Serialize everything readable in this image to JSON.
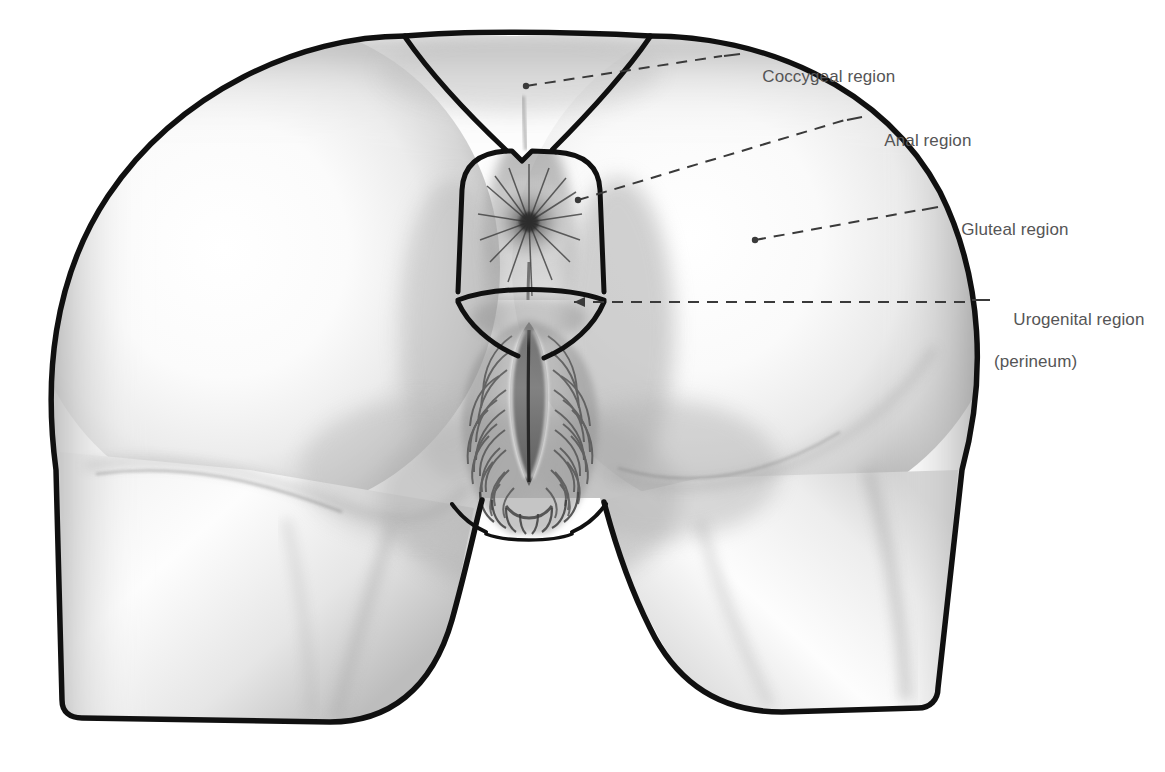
{
  "figure": {
    "kind": "anatomical-illustration",
    "medium": "graphite pencil drawing",
    "background_color": "#ffffff",
    "outline_color": "#101010",
    "label_color": "#555556",
    "leader_color": "#3a3a3a",
    "shading": {
      "skin_light": "#fdfdfd",
      "skin_mid": "#d9d9d9",
      "skin_dark": "#9a9a9a",
      "skin_deep": "#6e6e6e",
      "hair_dark": "#4a4a4a"
    }
  },
  "labels": [
    {
      "id": "coccygeal",
      "name": "coccygeal-region",
      "line1": "Coccygeal region",
      "line2": "",
      "text_x": 743,
      "text_y": 45,
      "dash_x1": 526,
      "dash_y1": 86,
      "dash_x2": 722,
      "dash_y2": 56,
      "tick_x1": 724,
      "tick_y1": 56,
      "tick_x2": 740,
      "tick_y2": 54,
      "dot_x": 526,
      "dot_y": 86
    },
    {
      "id": "anal",
      "name": "anal-region",
      "line1": "Anal region",
      "line2": "",
      "text_x": 866,
      "text_y": 109,
      "dash_x1": 578,
      "dash_y1": 200,
      "dash_x2": 845,
      "dash_y2": 120,
      "tick_x1": 847,
      "tick_y1": 120,
      "tick_x2": 862,
      "tick_y2": 117,
      "dot_x": 578,
      "dot_y": 200
    },
    {
      "id": "gluteal",
      "name": "gluteal-region",
      "line1": "Gluteal region",
      "line2": "",
      "text_x": 942,
      "text_y": 198,
      "dash_x1": 755,
      "dash_y1": 240,
      "dash_x2": 920,
      "dash_y2": 210,
      "tick_x1": 922,
      "tick_y1": 210,
      "tick_x2": 938,
      "tick_y2": 207,
      "dot_x": 755,
      "dot_y": 240
    },
    {
      "id": "urogenital",
      "name": "urogenital-region",
      "line1": "Urogenital region",
      "line2": "(perineum)",
      "text_x": 994,
      "text_y": 288,
      "dash_x1": 574,
      "dash_y1": 302,
      "dash_x2": 968,
      "dash_y2": 302,
      "tick_x1": 972,
      "tick_y1": 300,
      "tick_x2": 990,
      "tick_y2": 300,
      "dot_x": 574,
      "dot_y": 302
    }
  ],
  "regions": [
    {
      "id": "sacral-triangle",
      "name": "sacral-coccygeal-triangle"
    },
    {
      "id": "anal-triangle",
      "name": "anal-triangle-outline"
    },
    {
      "id": "urogenital-triangle",
      "name": "urogenital-triangle-outline"
    },
    {
      "id": "left-buttock",
      "name": "left-gluteal-mass"
    },
    {
      "id": "right-buttock",
      "name": "right-gluteal-mass"
    },
    {
      "id": "left-thigh",
      "name": "left-posterior-thigh"
    },
    {
      "id": "right-thigh",
      "name": "right-posterior-thigh"
    },
    {
      "id": "anus",
      "name": "anal-orifice"
    },
    {
      "id": "vulva",
      "name": "vulva-external-genitalia"
    }
  ]
}
